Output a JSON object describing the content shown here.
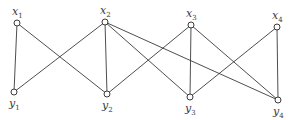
{
  "diagram": {
    "type": "bipartite-graph",
    "width": 293,
    "height": 120,
    "colors": {
      "stroke": "#3a3a3a",
      "node_fill": "#ffffff",
      "background": "#ffffff"
    },
    "nodes": [
      {
        "id": "x1",
        "base": "x",
        "sub": "1",
        "x": 17,
        "y": 23,
        "label_pos": "above"
      },
      {
        "id": "x2",
        "base": "x",
        "sub": "2",
        "x": 105,
        "y": 22,
        "label_pos": "above"
      },
      {
        "id": "x3",
        "base": "x",
        "sub": "3",
        "x": 191,
        "y": 25,
        "label_pos": "above"
      },
      {
        "id": "x4",
        "base": "x",
        "sub": "4",
        "x": 277,
        "y": 27,
        "label_pos": "above"
      },
      {
        "id": "y1",
        "base": "y",
        "sub": "1",
        "x": 14,
        "y": 92,
        "label_pos": "below"
      },
      {
        "id": "y2",
        "base": "y",
        "sub": "2",
        "x": 107,
        "y": 94,
        "label_pos": "below"
      },
      {
        "id": "y3",
        "base": "y",
        "sub": "3",
        "x": 190,
        "y": 97,
        "label_pos": "below"
      },
      {
        "id": "y4",
        "base": "y",
        "sub": "4",
        "x": 278,
        "y": 100,
        "label_pos": "below"
      }
    ],
    "edges": [
      [
        "x1",
        "y1"
      ],
      [
        "x1",
        "y2"
      ],
      [
        "x2",
        "y1"
      ],
      [
        "x2",
        "y2"
      ],
      [
        "x2",
        "y3"
      ],
      [
        "x2",
        "y4"
      ],
      [
        "x3",
        "y2"
      ],
      [
        "x3",
        "y3"
      ],
      [
        "x3",
        "y4"
      ],
      [
        "x4",
        "y3"
      ],
      [
        "x4",
        "y4"
      ]
    ]
  }
}
